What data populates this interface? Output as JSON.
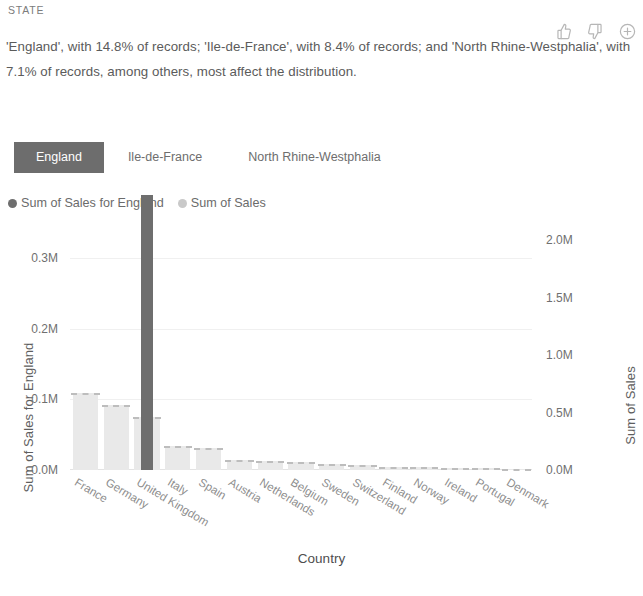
{
  "header": {
    "kicker": "STATE",
    "summary": "'England', with 14.8% of records; 'Ile-de-France', with 8.4% of records; and 'North Rhine-Westphalia', with 7.1% of records, among others, most affect the distribution."
  },
  "reactions": [
    {
      "name": "thumbs-up-icon",
      "label": "Thumbs up"
    },
    {
      "name": "thumbs-down-icon",
      "label": "Thumbs down"
    },
    {
      "name": "plus-circle-icon",
      "label": "Add"
    }
  ],
  "tabs": [
    {
      "label": "England",
      "selected": true
    },
    {
      "label": "Ile-de-France",
      "selected": false
    },
    {
      "label": "North Rhine-Westphalia",
      "selected": false
    }
  ],
  "legend": [
    {
      "label": "Sum of Sales for England",
      "color": "#6e6e6e"
    },
    {
      "label": "Sum of Sales",
      "color": "#c9c9c9"
    }
  ],
  "colors": {
    "selected_chip_bg": "#6d6d6d",
    "series_front": "#6e6e6e",
    "series_back": "#e9e9e9",
    "dashed_line": "#bdbdbd",
    "gridline": "#f0f0f0"
  },
  "chart_data": {
    "type": "bar",
    "title": "",
    "xlabel": "Country",
    "ylabel": "Sum of Sales for England",
    "y2label": "Sum of Sales",
    "grid": true,
    "legend_position": "top-left",
    "categories": [
      "France",
      "Germany",
      "United Kingdom",
      "Italy",
      "Spain",
      "Austria",
      "Netherlands",
      "Belgium",
      "Sweden",
      "Switzerland",
      "Finland",
      "Norway",
      "Ireland",
      "Portugal",
      "Denmark"
    ],
    "ylim": [
      0,
      0.35
    ],
    "yticks": [
      "0.0M",
      "0.1M",
      "0.2M",
      "0.3M"
    ],
    "ytick_values": [
      0,
      0.1,
      0.2,
      0.3
    ],
    "y2lim": [
      0,
      2.15
    ],
    "y2ticks": [
      "0.0M",
      "0.5M",
      "1.0M",
      "1.5M",
      "2.0M"
    ],
    "y2tick_values": [
      0,
      0.5,
      1.0,
      1.5,
      2.0
    ],
    "series": [
      {
        "name": "Sum of Sales for England",
        "axis": "left",
        "unit": "M",
        "values": [
          0,
          0,
          0.39,
          0,
          0,
          0,
          0,
          0,
          0,
          0,
          0,
          0,
          0,
          0,
          0
        ]
      },
      {
        "name": "Sum of Sales",
        "axis": "right",
        "unit": "M",
        "values": [
          0.67,
          0.57,
          0.46,
          0.21,
          0.19,
          0.09,
          0.08,
          0.07,
          0.05,
          0.04,
          0.03,
          0.03,
          0.02,
          0.02,
          0.01
        ]
      }
    ]
  }
}
